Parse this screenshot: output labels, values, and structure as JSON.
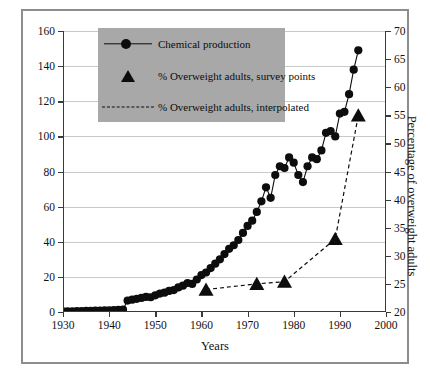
{
  "figure": {
    "background": "#ffffff",
    "frame_color": "#8d8d8d",
    "legend_background": "#a8a8a8",
    "ink_color": "#0d0d0d",
    "grid_color": "#c9c9c9"
  },
  "legend": {
    "items": [
      {
        "key": "line-with-circle",
        "label": "Chemical production"
      },
      {
        "key": "triangle",
        "label": "% Overweight adults, survey points"
      },
      {
        "key": "dashed-line",
        "label": "% Overweight adults, interpolated"
      }
    ]
  },
  "chart_data": {
    "type": "line",
    "title": "",
    "xlabel": "Years",
    "ylabel": "Synthetic Chemical Production (billion kgs/year)",
    "y2label": "Percentage of overweight adults",
    "xlim": [
      1930,
      2000
    ],
    "ylim": [
      0,
      160
    ],
    "y2lim": [
      20,
      70
    ],
    "xticks": [
      1930,
      1940,
      1950,
      1960,
      1970,
      1980,
      1990,
      2000
    ],
    "xticklabels": [
      "1930",
      "1940",
      "1950",
      "1960",
      "1970",
      "1980",
      "1990",
      "2000"
    ],
    "yticks": [
      0,
      20,
      40,
      60,
      80,
      100,
      120,
      140,
      160
    ],
    "yticklabels": [
      "0",
      "20",
      "40",
      "60",
      "80",
      "100",
      "120",
      "140",
      "160"
    ],
    "y2ticks": [
      20,
      25,
      30,
      35,
      40,
      45,
      50,
      55,
      60,
      65,
      70
    ],
    "y2ticklabels": [
      "20",
      "25",
      "30",
      "35",
      "40",
      "45",
      "50",
      "55",
      "60",
      "65",
      "70"
    ],
    "grid": true,
    "grid_axis": "y",
    "legend_position": "upper left",
    "series": [
      {
        "name": "Chemical production",
        "axis": "left",
        "marker": "circle",
        "linestyle": "solid",
        "x": [
          1930,
          1931,
          1932,
          1933,
          1934,
          1935,
          1936,
          1937,
          1938,
          1939,
          1940,
          1941,
          1942,
          1943,
          1944,
          1945,
          1946,
          1947,
          1948,
          1949,
          1950,
          1951,
          1952,
          1953,
          1954,
          1955,
          1956,
          1957,
          1958,
          1959,
          1960,
          1961,
          1962,
          1963,
          1964,
          1965,
          1966,
          1967,
          1968,
          1969,
          1970,
          1971,
          1972,
          1973,
          1974,
          1975,
          1976,
          1977,
          1978,
          1979,
          1980,
          1981,
          1982,
          1983,
          1984,
          1985,
          1986,
          1987,
          1988,
          1989,
          1990,
          1991,
          1992,
          1993,
          1994
        ],
        "y": [
          0.4,
          0.4,
          0.4,
          0.5,
          0.5,
          0.6,
          0.7,
          0.8,
          0.8,
          0.9,
          1.0,
          1.1,
          1.2,
          1.4,
          6.5,
          7.0,
          7.5,
          8.0,
          8.6,
          8.4,
          9.5,
          10.5,
          11.0,
          12.0,
          12.5,
          14.0,
          15.0,
          16.5,
          16.0,
          18.5,
          21.0,
          22.5,
          25.0,
          27.5,
          30.0,
          33.0,
          36.0,
          38.0,
          41.0,
          45.0,
          49.0,
          52.0,
          57.0,
          63.0,
          71.0,
          65.0,
          78.0,
          83.0,
          82.0,
          88.0,
          85.0,
          78.0,
          74.0,
          83.0,
          88.0,
          87.0,
          92.0,
          102.0,
          103.0,
          100.0,
          113.0,
          114.0,
          124.0,
          138.0,
          149.0
        ]
      },
      {
        "name": "% Overweight adults, survey points",
        "axis": "right",
        "marker": "triangle",
        "linestyle": "none",
        "x": [
          1961,
          1972,
          1978,
          1989,
          1994
        ],
        "y": [
          24.0,
          25.0,
          25.4,
          33.0,
          55.0
        ]
      },
      {
        "name": "% Overweight adults, interpolated",
        "axis": "right",
        "marker": "none",
        "linestyle": "dashed",
        "x": [
          1961,
          1972,
          1978,
          1989,
          1994
        ],
        "y": [
          24.0,
          25.0,
          25.4,
          33.0,
          55.0
        ]
      }
    ]
  }
}
